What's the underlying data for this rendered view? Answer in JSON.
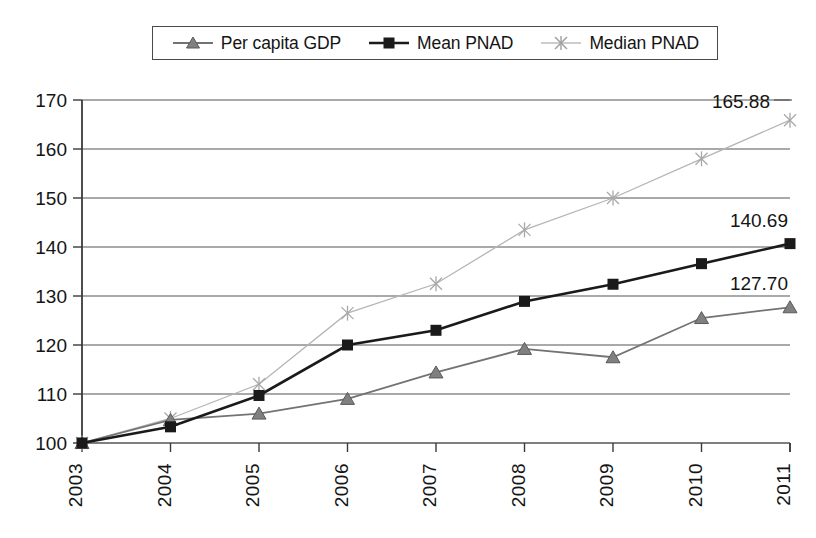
{
  "chart_data": {
    "type": "line",
    "title": "",
    "subtitle": "",
    "xlabel": "",
    "ylabel": "",
    "categories": [
      "2003",
      "2004",
      "2005",
      "2006",
      "2007",
      "2008",
      "2009",
      "2010",
      "2011"
    ],
    "ylim": [
      100,
      170
    ],
    "ytick_step": 10,
    "yticks": [
      "100",
      "110",
      "120",
      "130",
      "140",
      "150",
      "160",
      "170"
    ],
    "grid": "horizontal",
    "legend_position": "top-center",
    "series": [
      {
        "name": "Per capita GDP",
        "marker": "triangle",
        "color": "#737373",
        "values": [
          100.0,
          104.7,
          106.0,
          109.0,
          114.4,
          119.2,
          117.5,
          125.5,
          127.7
        ],
        "end_label": "127.70"
      },
      {
        "name": "Mean PNAD",
        "marker": "square",
        "color": "#1a1a1a",
        "values": [
          100.0,
          103.3,
          109.7,
          120.0,
          123.0,
          128.9,
          132.4,
          136.6,
          140.69
        ],
        "end_label": "140.69"
      },
      {
        "name": "Median PNAD",
        "marker": "asterisk",
        "color": "#b5b5b5",
        "values": [
          100.0,
          105.0,
          112.0,
          126.5,
          132.5,
          143.5,
          150.0,
          158.0,
          165.88
        ],
        "end_label": "165.88"
      }
    ]
  },
  "legend": {
    "items": [
      {
        "label": "Per capita GDP"
      },
      {
        "label": "Mean PNAD"
      },
      {
        "label": "Median PNAD"
      }
    ]
  },
  "end_labels": [
    {
      "text": "165.88"
    },
    {
      "text": "140.69"
    },
    {
      "text": "127.70"
    }
  ]
}
